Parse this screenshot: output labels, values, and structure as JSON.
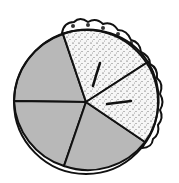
{
  "diagram": {
    "type": "fraction-pie-illustration",
    "total_slices": 5,
    "slices_with_pie": 2,
    "empty_slices": 3,
    "colors": {
      "empty_fill": "#b8b8b8",
      "pie_fill": "#f4f4f4",
      "crust": "#ffffff",
      "outline": "#111111"
    }
  }
}
